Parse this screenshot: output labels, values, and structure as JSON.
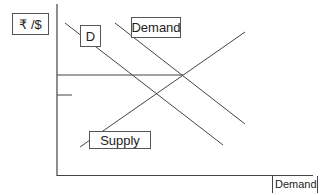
{
  "diagram": {
    "y_axis_label": "₹ /$",
    "x_axis_label": "Demand",
    "labels": {
      "d": "D",
      "demand": "Demand",
      "supply": "Supply"
    },
    "colors": {
      "line": "#444444",
      "box_border": "#555555",
      "text": "#222222"
    }
  }
}
